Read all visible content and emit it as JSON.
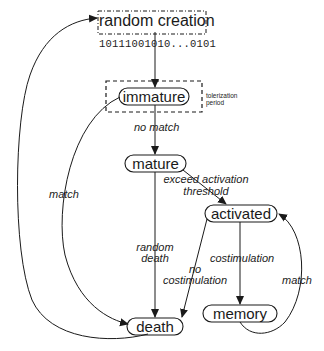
{
  "diagram": {
    "colors": {
      "stroke": "#1a1a1a",
      "background": "#ffffff"
    },
    "nodes": {
      "random_creation": {
        "label": "random creation",
        "bitstring": "10111001010...0101",
        "border": "dash-dot"
      },
      "immature": {
        "label": "immature",
        "group_label": "tolerization period",
        "group_border": "dashed"
      },
      "mature": {
        "label": "mature"
      },
      "activated": {
        "label": "activated"
      },
      "memory": {
        "label": "memory"
      },
      "death": {
        "label": "death"
      }
    },
    "edges": [
      {
        "from": "random_creation",
        "to": "immature",
        "label": ""
      },
      {
        "from": "immature",
        "to": "mature",
        "label": "no match"
      },
      {
        "from": "immature",
        "to": "death",
        "label": "match"
      },
      {
        "from": "mature",
        "to": "activated",
        "label": "exceed activation threshold",
        "label_lines": [
          "exceed activation",
          "threshold"
        ]
      },
      {
        "from": "mature",
        "to": "death",
        "label": "random death",
        "label_lines": [
          "random",
          "death"
        ]
      },
      {
        "from": "activated",
        "to": "memory",
        "label": "costimulation"
      },
      {
        "from": "activated",
        "to": "death",
        "label": "no costimulation",
        "label_lines": [
          "no",
          "costimulation"
        ]
      },
      {
        "from": "memory",
        "to": "activated",
        "label": "match"
      },
      {
        "from": "death",
        "to": "random_creation",
        "label": ""
      }
    ]
  }
}
